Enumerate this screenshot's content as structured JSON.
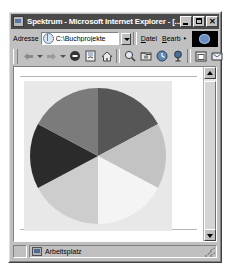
{
  "window": {
    "title": "Spektrum - Microsoft Internet Explorer - [...",
    "icon": "ie-document-icon",
    "controls": {
      "minimize": "_",
      "maximize": "□",
      "close": "✕"
    }
  },
  "address_bar": {
    "label": "Adresse",
    "value": "C:\\Buchprojekte",
    "placeholder": "C:\\Buchprojekte",
    "globe_icon": "globe-icon",
    "dropdown_icon": "chevron-down-icon"
  },
  "menu": {
    "items": [
      {
        "label": "Datei",
        "accel": "D"
      },
      {
        "label": "Bearb",
        "accel": "B"
      }
    ],
    "logo": "ie-logo"
  },
  "toolbar": {
    "buttons": [
      {
        "name": "back-button",
        "icon": "arrow-left-icon",
        "label": "Zurück"
      },
      {
        "name": "forward-button",
        "icon": "arrow-right-icon",
        "label": "Vorwärts"
      },
      {
        "name": "stop-button",
        "icon": "stop-icon",
        "label": "Abbrechen"
      },
      {
        "name": "refresh-button",
        "icon": "refresh-icon",
        "label": "Aktualisieren"
      },
      {
        "name": "home-button",
        "icon": "home-icon",
        "label": "Startseite"
      },
      {
        "name": "search-button",
        "icon": "search-icon",
        "label": "Suchen"
      },
      {
        "name": "favorites-button",
        "icon": "favorites-icon",
        "label": "Favoriten"
      },
      {
        "name": "history-button",
        "icon": "history-icon",
        "label": "Verlauf"
      },
      {
        "name": "channels-button",
        "icon": "channels-icon",
        "label": "Kanäle"
      },
      {
        "name": "fullscreen-button",
        "icon": "fullscreen-icon",
        "label": "Vollbild"
      },
      {
        "name": "mail-button",
        "icon": "mail-icon",
        "label": "Mail"
      }
    ]
  },
  "status_bar": {
    "zone_icon": "computer-icon",
    "text": "Arbeitsplatz"
  },
  "scrollbar": {
    "up_icon": "arrow-up-icon",
    "down_icon": "arrow-down-icon",
    "thumb": "scroll-thumb"
  },
  "chart_data": {
    "type": "pie",
    "title": "",
    "background": "#e8e8e8",
    "center": [
      74,
      75
    ],
    "radius": 68,
    "legend": "none",
    "categories": [
      "Segment 1",
      "Segment 2",
      "Segment 3",
      "Segment 4",
      "Segment 5",
      "Segment 6"
    ],
    "values": [
      17,
      17,
      16,
      17,
      16,
      17
    ],
    "slices": [
      {
        "label": "Segment 1",
        "start_angle": 0,
        "end_angle": 62,
        "color": "#565656",
        "value": 17
      },
      {
        "label": "Segment 2",
        "start_angle": 62,
        "end_angle": 118,
        "color": "#c3c3c3",
        "value": 16
      },
      {
        "label": "Segment 3",
        "start_angle": 118,
        "end_angle": 180,
        "color": "#f4f4f4",
        "value": 17
      },
      {
        "label": "Segment 4",
        "start_angle": 180,
        "end_angle": 242,
        "color": "#cdcdcd",
        "value": 17
      },
      {
        "label": "Segment 5",
        "start_angle": 242,
        "end_angle": 298,
        "color": "#2b2b2b",
        "value": 16
      },
      {
        "label": "Segment 6",
        "start_angle": 298,
        "end_angle": 360,
        "color": "#7b7b7b",
        "value": 17
      }
    ]
  }
}
